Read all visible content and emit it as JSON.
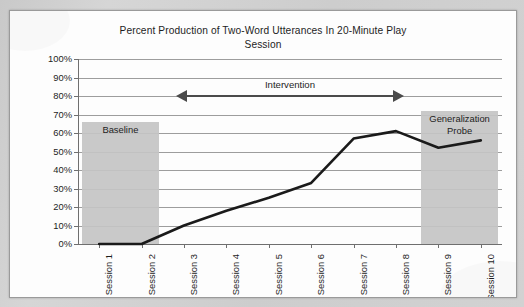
{
  "document": {
    "page_background": "#d0d0d0",
    "panel_background": "#fdfdfd",
    "panel_border": "#9a9a9a"
  },
  "chart_data": {
    "type": "line",
    "title": "Percent Production of Two-Word Utterances In 20-Minute Play Session",
    "title_line1": "Percent Production of Two-Word Utterances In 20-Minute Play",
    "title_line2": "Session",
    "xlabel": "",
    "ylabel": "",
    "categories": [
      "Session 1",
      "Session 2",
      "Session 3",
      "Session 4",
      "Session 5",
      "Session 6",
      "Session 7",
      "Session 8",
      "Session 9",
      "Session 10"
    ],
    "values": [
      0,
      0,
      10,
      18,
      25,
      33,
      57,
      61,
      52,
      56
    ],
    "series": [
      {
        "name": "Percent production of two-word utterances",
        "values": [
          0,
          0,
          10,
          18,
          25,
          33,
          57,
          61,
          52,
          56
        ],
        "color": "#1a1a1a",
        "line_width": 2.6
      }
    ],
    "ylim": [
      0,
      100
    ],
    "y_ticks": [
      0,
      10,
      20,
      30,
      40,
      50,
      60,
      70,
      80,
      90,
      100
    ],
    "y_tick_labels": [
      "0%",
      "10%",
      "20%",
      "30%",
      "40%",
      "50%",
      "60%",
      "70%",
      "80%",
      "90%",
      "100%"
    ],
    "y_tick_suffix": "%",
    "grid": true,
    "grid_color": "#9d9d9d",
    "legend": false,
    "legend_position": "none",
    "x_tick_label_rotation": -90,
    "annotations": [
      {
        "id": "baseline",
        "type": "shaded-band",
        "label": "Baseline",
        "label_lines": [
          "Baseline"
        ],
        "x_start_category": "Session 1",
        "x_end_category": "Session 2",
        "y_start": 0,
        "y_end": 66,
        "color": "#c4c4c4"
      },
      {
        "id": "generalization-probe",
        "type": "shaded-band",
        "label": "Generalization Probe",
        "label_lines": [
          "Generalization",
          "Probe"
        ],
        "x_start_category": "Session 9",
        "x_end_category": "Session 10",
        "y_start": 0,
        "y_end": 72,
        "color": "#c4c4c4"
      },
      {
        "id": "intervention",
        "type": "double-arrow",
        "label": "Intervention",
        "x_start_category": "Session 3",
        "x_end_category": "Session 8",
        "y": 80,
        "color": "#4a4a4a"
      }
    ]
  }
}
